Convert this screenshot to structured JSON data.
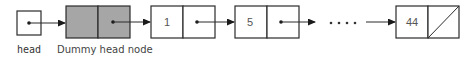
{
  "diagram": {
    "head_label": "head",
    "dummy_label": "Dummy head node",
    "nodes": [
      {
        "value": "1"
      },
      {
        "value": "5"
      },
      {
        "value": "44",
        "null_next": true
      }
    ],
    "ellipsis": "••••",
    "colors": {
      "dummy_fill": "#a6a6a6",
      "stroke": "#2b2b2b"
    }
  }
}
